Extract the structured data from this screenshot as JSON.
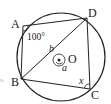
{
  "diagram": {
    "type": "inscribed-quadrilateral",
    "points": {
      "A": "A",
      "B": "B",
      "C": "C",
      "D": "D",
      "O": "O"
    },
    "angles": {
      "angle_A": "100°",
      "angle_C": "x",
      "central_a": "a",
      "central_b": "b"
    },
    "margin_fragment": "°'",
    "colors": {
      "ink": "#222222",
      "background": "#ffffff"
    }
  }
}
